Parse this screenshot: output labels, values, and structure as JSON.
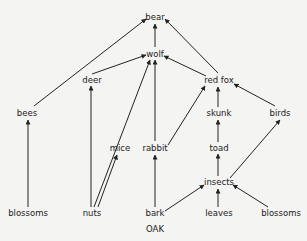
{
  "diagram": {
    "type": "food-web",
    "colors": {
      "background": "#f4f4f2",
      "line": "#222222",
      "text": "#222222"
    },
    "nodes": [
      {
        "id": "bear",
        "label": "bear",
        "x": 155,
        "y": 17
      },
      {
        "id": "wolf",
        "label": "wolf",
        "x": 155,
        "y": 54
      },
      {
        "id": "deer",
        "label": "deer",
        "x": 92,
        "y": 80
      },
      {
        "id": "redfox",
        "label": "red fox",
        "x": 219,
        "y": 80
      },
      {
        "id": "bees",
        "label": "bees",
        "x": 27,
        "y": 113
      },
      {
        "id": "skunk",
        "label": "skunk",
        "x": 219,
        "y": 113
      },
      {
        "id": "birds",
        "label": "birds",
        "x": 280,
        "y": 113
      },
      {
        "id": "mice",
        "label": "mice",
        "x": 120,
        "y": 148
      },
      {
        "id": "rabbit",
        "label": "rabbit",
        "x": 155,
        "y": 148
      },
      {
        "id": "toad",
        "label": "toad",
        "x": 219,
        "y": 148
      },
      {
        "id": "insects",
        "label": "insects",
        "x": 219,
        "y": 182
      },
      {
        "id": "blossoms1",
        "label": "blossoms",
        "x": 28,
        "y": 213
      },
      {
        "id": "nuts",
        "label": "nuts",
        "x": 92,
        "y": 213
      },
      {
        "id": "bark",
        "label": "bark",
        "x": 155,
        "y": 213
      },
      {
        "id": "leaves",
        "label": "leaves",
        "x": 219,
        "y": 213
      },
      {
        "id": "blossoms2",
        "label": "blossoms",
        "x": 281,
        "y": 213
      }
    ],
    "caption": {
      "label": "OAK",
      "x": 155,
      "y": 229
    },
    "edges": [
      {
        "from": "wolf",
        "to": "bear",
        "x1": 155,
        "y1": 47,
        "x2": 155,
        "y2": 24
      },
      {
        "from": "bees",
        "to": "bear",
        "x1": 34,
        "y1": 106,
        "x2": 146,
        "y2": 19
      },
      {
        "from": "redfox",
        "to": "bear",
        "x1": 218,
        "y1": 73,
        "x2": 165,
        "y2": 19
      },
      {
        "from": "deer",
        "to": "wolf",
        "x1": 92,
        "y1": 74,
        "x2": 146,
        "y2": 55
      },
      {
        "from": "redfox",
        "to": "wolf",
        "x1": 206,
        "y1": 76,
        "x2": 164,
        "y2": 56
      },
      {
        "from": "nuts",
        "to": "deer",
        "x1": 91,
        "y1": 207,
        "x2": 91,
        "y2": 86
      },
      {
        "from": "nuts",
        "to": "wolf",
        "x1": 94,
        "y1": 207,
        "x2": 150,
        "y2": 60
      },
      {
        "from": "rabbit",
        "to": "wolf",
        "x1": 155,
        "y1": 141,
        "x2": 155,
        "y2": 60
      },
      {
        "from": "nuts",
        "to": "mice",
        "x1": 98,
        "y1": 207,
        "x2": 117,
        "y2": 155
      },
      {
        "from": "rabbit",
        "to": "redfox",
        "x1": 168,
        "y1": 145,
        "x2": 205,
        "y2": 86
      },
      {
        "from": "skunk",
        "to": "redfox",
        "x1": 218,
        "y1": 107,
        "x2": 218,
        "y2": 87
      },
      {
        "from": "birds",
        "to": "redfox",
        "x1": 275,
        "y1": 106,
        "x2": 234,
        "y2": 84
      },
      {
        "from": "toad",
        "to": "skunk",
        "x1": 218,
        "y1": 142,
        "x2": 218,
        "y2": 120
      },
      {
        "from": "insects",
        "to": "toad",
        "x1": 218,
        "y1": 176,
        "x2": 218,
        "y2": 154
      },
      {
        "from": "insects",
        "to": "birds",
        "x1": 230,
        "y1": 178,
        "x2": 280,
        "y2": 120
      },
      {
        "from": "blossoms1",
        "to": "bees",
        "x1": 28,
        "y1": 207,
        "x2": 28,
        "y2": 120
      },
      {
        "from": "bark",
        "to": "rabbit",
        "x1": 155,
        "y1": 207,
        "x2": 155,
        "y2": 155
      },
      {
        "from": "bark",
        "to": "insects",
        "x1": 165,
        "y1": 211,
        "x2": 204,
        "y2": 185
      },
      {
        "from": "leaves",
        "to": "insects",
        "x1": 218,
        "y1": 207,
        "x2": 218,
        "y2": 189
      },
      {
        "from": "blossoms2",
        "to": "insects",
        "x1": 268,
        "y1": 207,
        "x2": 233,
        "y2": 185
      }
    ]
  }
}
